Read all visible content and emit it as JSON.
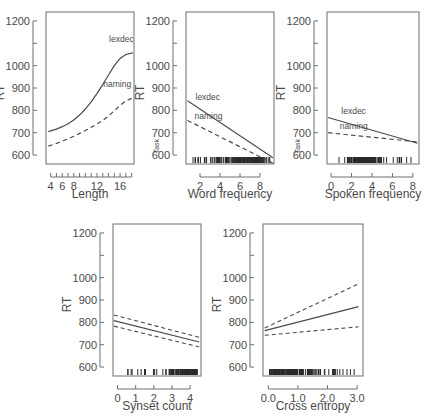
{
  "figure": {
    "name": "partial-effects-panel-figure",
    "panel_count": 5,
    "shared_ylabel": "RT",
    "shared_ylim": [
      560,
      1240
    ],
    "shared_yticks_major": [
      600,
      700,
      800,
      900,
      1000,
      1200
    ],
    "shared_yticks_minor": [
      1100
    ],
    "group_label": "Task",
    "series_labels": [
      "lexdec",
      "naming"
    ],
    "colors": {
      "line": "#4a4a4a",
      "axis": "#6e6e6e",
      "rug": "#2a2a2a",
      "background": "#ffffff"
    }
  },
  "chart_data": [
    {
      "type": "line",
      "panel_index": 1,
      "title": "",
      "xlabel": "Length",
      "ylabel": "RT",
      "group_label": "",
      "xlim": [
        3.2,
        18.4
      ],
      "ylim": [
        560,
        1240
      ],
      "xticks": [
        4,
        5,
        6,
        7,
        8,
        9,
        10,
        11,
        12,
        13,
        14,
        15,
        16,
        17,
        18
      ],
      "xtick_labels": [
        "4",
        "6",
        "8",
        "12",
        "16"
      ],
      "xtick_labeled_values": [
        4,
        6,
        8,
        12,
        16
      ],
      "yticks": [
        600,
        700,
        800,
        900,
        1000,
        1100,
        1200
      ],
      "ytick_labels": [
        "600",
        "700",
        "800",
        "900",
        "1000",
        "",
        "1200"
      ],
      "grid": false,
      "legend": "inline-curve-labels",
      "rug": false,
      "series": [
        {
          "name": "lexdec",
          "style": "solid",
          "label_position": {
            "x": 14.1,
            "y": 1105
          },
          "x": [
            3.6,
            5,
            6,
            7,
            8,
            9,
            10,
            11,
            12,
            13,
            14,
            15,
            16,
            17,
            18.2
          ],
          "values": [
            705,
            716,
            727,
            740,
            757,
            779,
            806,
            838,
            875,
            915,
            958,
            1000,
            1032,
            1050,
            1057
          ]
        },
        {
          "name": "naming",
          "style": "dashed",
          "label_position": {
            "x": 13.1,
            "y": 905
          },
          "x": [
            3.6,
            5,
            6,
            7,
            8,
            9,
            10,
            11,
            12,
            13,
            14,
            15,
            16,
            17,
            18.2
          ],
          "values": [
            640,
            652,
            662,
            673,
            684,
            697,
            710,
            724,
            739,
            755,
            775,
            798,
            822,
            842,
            856
          ]
        }
      ]
    },
    {
      "type": "line",
      "panel_index": 2,
      "title": "",
      "xlabel": "Word frequency",
      "ylabel": "RT",
      "group_label": "Task",
      "xlim": [
        0.6,
        9.4
      ],
      "ylim": [
        560,
        1240
      ],
      "xticks": [
        2,
        4,
        6,
        8
      ],
      "xtick_labels": [
        "2",
        "4",
        "6",
        "8"
      ],
      "yticks": [
        600,
        700,
        800,
        900,
        1000,
        1100,
        1200
      ],
      "ytick_labels": [
        "600",
        "700",
        "800",
        "900",
        "1000",
        "",
        "1200"
      ],
      "grid": false,
      "legend": "inline-curve-labels",
      "rug": true,
      "rug_density": "dense between 2 and 8, peak near 6-7",
      "series": [
        {
          "name": "lexdec",
          "style": "solid",
          "label_position": {
            "x": 1.55,
            "y": 845
          },
          "x": [
            0.75,
            9.3
          ],
          "values": [
            843,
            588
          ]
        },
        {
          "name": "naming",
          "style": "dashed",
          "label_position": {
            "x": 1.45,
            "y": 762
          },
          "x": [
            0.75,
            9.3
          ],
          "values": [
            755,
            563
          ]
        }
      ]
    },
    {
      "type": "line",
      "panel_index": 3,
      "title": "",
      "xlabel": "Spoken frequency",
      "ylabel": "RT",
      "group_label": "Task",
      "xlim": [
        -0.4,
        8.6
      ],
      "ylim": [
        560,
        1240
      ],
      "xticks": [
        0,
        2,
        4,
        6,
        8
      ],
      "xtick_labels": [
        "0",
        "2",
        "4",
        "6",
        "8"
      ],
      "yticks": [
        600,
        700,
        800,
        900,
        1000,
        1100,
        1200
      ],
      "ytick_labels": [
        "600",
        "700",
        "800",
        "900",
        "1000",
        "",
        "1200"
      ],
      "grid": false,
      "legend": "inline-curve-labels",
      "rug": true,
      "rug_density": "dense between 2.5 and 4.5, sparse to 8",
      "series": [
        {
          "name": "lexdec",
          "style": "solid",
          "label_position": {
            "x": 1.0,
            "y": 783
          },
          "x": [
            -0.3,
            8.45
          ],
          "values": [
            768,
            653
          ]
        },
        {
          "name": "naming",
          "style": "dashed",
          "label_position": {
            "x": 0.85,
            "y": 718
          },
          "x": [
            -0.3,
            8.45
          ],
          "values": [
            700,
            659
          ]
        }
      ]
    },
    {
      "type": "line",
      "panel_index": 4,
      "title": "",
      "xlabel": "Synset count",
      "ylabel": "RT",
      "group_label": "",
      "xlim": [
        -0.25,
        4.6
      ],
      "ylim": [
        560,
        1240
      ],
      "xticks": [
        0,
        1,
        2,
        3,
        4
      ],
      "xtick_labels": [
        "0",
        "1",
        "2",
        "3",
        "4"
      ],
      "yticks": [
        600,
        700,
        800,
        900,
        1000,
        1100,
        1200
      ],
      "ytick_labels": [
        "600",
        "700",
        "800",
        "900",
        "1000",
        "",
        "1200"
      ],
      "grid": false,
      "legend": "none",
      "rug": true,
      "rug_density": "sparse 0.6-3, very dense 3.1-4.3",
      "series": [
        {
          "name": "fit",
          "style": "solid",
          "x": [
            -0.2,
            4.5
          ],
          "values": [
            808,
            712
          ]
        },
        {
          "name": "upper confidence band",
          "style": "dashed",
          "x": [
            -0.2,
            4.5
          ],
          "values": [
            833,
            733
          ]
        },
        {
          "name": "lower confidence band",
          "style": "dashed",
          "x": [
            -0.2,
            4.5
          ],
          "values": [
            783,
            690
          ]
        }
      ]
    },
    {
      "type": "line",
      "panel_index": 5,
      "title": "",
      "xlabel": "Cross entropy",
      "ylabel": "RT",
      "group_label": "",
      "xlim": [
        -0.18,
        3.2
      ],
      "ylim": [
        560,
        1240
      ],
      "xticks": [
        0.0,
        1.0,
        2.0,
        3.0
      ],
      "xtick_labels": [
        "0.0",
        "1.0",
        "2.0",
        "3.0"
      ],
      "yticks": [
        600,
        700,
        800,
        900,
        1000,
        1100,
        1200
      ],
      "ytick_labels": [
        "600",
        "700",
        "800",
        "900",
        "1000",
        "",
        "1200"
      ],
      "grid": false,
      "legend": "none",
      "rug": true,
      "rug_density": "very dense 0.0-1.5, sparse 1.6-3.0",
      "series": [
        {
          "name": "fit",
          "style": "solid",
          "x": [
            -0.12,
            3.05
          ],
          "values": [
            763,
            870
          ]
        },
        {
          "name": "upper confidence band",
          "style": "dashed",
          "x": [
            -0.12,
            3.05
          ],
          "values": [
            775,
            972
          ]
        },
        {
          "name": "lower confidence band",
          "style": "dashed",
          "x": [
            -0.12,
            3.05
          ],
          "values": [
            742,
            780
          ]
        }
      ]
    }
  ]
}
